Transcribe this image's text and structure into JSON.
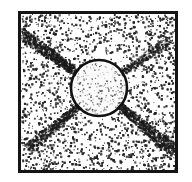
{
  "figure": {
    "title": "Scanned halftone micrograph: circular object with four diagonal radiating streaks",
    "caption": "",
    "canvas": {
      "width": 192,
      "height": 182,
      "background": "#ffffff"
    },
    "colors": {
      "background": "#ffffff",
      "ink": "#1a1a1a",
      "frame": "#141414",
      "stipple": "#222222",
      "circle_outline": "#111111",
      "circle_fill": "#fbfbfb"
    },
    "frame": {
      "name": "image-border",
      "x": 18,
      "y": 11,
      "width": 160,
      "height": 162,
      "stroke_width": 3,
      "color": "#141414"
    },
    "circle": {
      "name": "central-circle",
      "center_x": 99,
      "center_y": 88,
      "radius": 28,
      "stroke_width": 2.6,
      "outline_color": "#111111",
      "fill_color": "#fbfbfb"
    },
    "rays": [
      {
        "name": "ray-upper-left",
        "angle_deg": 215,
        "length": 74,
        "width": 7,
        "darkness": 0.85
      },
      {
        "name": "ray-upper-right",
        "angle_deg": 325,
        "length": 62,
        "width": 5,
        "darkness": 0.45
      },
      {
        "name": "ray-lower-left",
        "angle_deg": 140,
        "length": 70,
        "width": 6,
        "darkness": 0.7
      },
      {
        "name": "ray-lower-right",
        "angle_deg": 40,
        "length": 74,
        "width": 7,
        "darkness": 0.88
      }
    ],
    "texture": {
      "name": "halftone-stipple",
      "description": "dense random black speckle over the framed interior, sparser inside the circle and within the wedge sectors between rays",
      "interior_dot_count": 5200,
      "circle_dot_count": 210,
      "density_gradient": "denser at left and upper-left, sparser toward right edge"
    }
  }
}
